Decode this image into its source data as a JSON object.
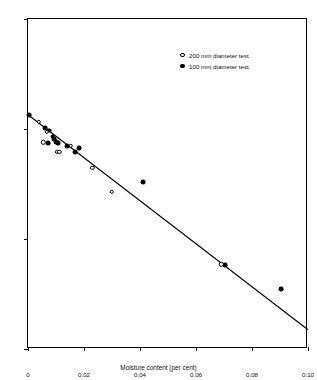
{
  "figure": {
    "top_caption_fragment": "",
    "xlabel": "Moisture content (per cent)",
    "ylabel": "Calibration bulk density (Mg/m³)"
  },
  "legend": {
    "entries": [
      {
        "marker": "open-circle-marker",
        "label": "200 mm diameter test"
      },
      {
        "marker": "filled-circle-marker",
        "label": "100 mm diameter test"
      }
    ]
  },
  "axes": {
    "y_ticks": [
      "1.6",
      "1.5",
      "1.4",
      "1.3"
    ],
    "x_ticks": [
      "0",
      "0.02",
      "0.04",
      "0.06",
      "0.08",
      "0.10"
    ]
  },
  "chart_data": {
    "type": "scatter",
    "title": "",
    "xlabel": "Moisture content (per cent)",
    "ylabel": "Calibration bulk density (Mg/m³)",
    "xlim": [
      0,
      0.1
    ],
    "ylim": [
      1.3,
      1.6
    ],
    "xticks": [
      0,
      0.02,
      0.04,
      0.06,
      0.08,
      0.1
    ],
    "yticks": [
      1.3,
      1.4,
      1.5,
      1.6
    ],
    "grid": false,
    "legend_position": "top-center",
    "series": [
      {
        "name": "100 mm diameter test",
        "marker": "filled-circle",
        "color": "#000000",
        "points": [
          [
            0.0005,
            1.5125
          ],
          [
            0.0062,
            1.5005
          ],
          [
            0.0075,
            1.4985
          ],
          [
            0.0088,
            1.493
          ],
          [
            0.0093,
            1.4905
          ],
          [
            0.01,
            1.488
          ],
          [
            0.0108,
            1.4875
          ],
          [
            0.0072,
            1.487
          ],
          [
            0.014,
            1.4845
          ],
          [
            0.0182,
            1.4825
          ],
          [
            0.0168,
            1.479
          ],
          [
            0.041,
            1.452
          ],
          [
            0.0705,
            1.376
          ],
          [
            0.0905,
            1.3545
          ]
        ]
      },
      {
        "name": "200 mm diameter test",
        "marker": "open-circle",
        "color": "#000000",
        "points": [
          [
            0.0038,
            1.5065
          ],
          [
            0.0068,
            1.4975
          ],
          [
            0.0055,
            1.488
          ],
          [
            0.0105,
            1.4795
          ],
          [
            0.0112,
            1.4795
          ],
          [
            0.0152,
            1.4845
          ],
          [
            0.023,
            1.465
          ],
          [
            0.03,
            1.443
          ],
          [
            0.069,
            1.377
          ]
        ]
      }
    ],
    "trend_line": {
      "type": "linear-fit",
      "x_start": 0.0,
      "y_start": 1.513,
      "x_end": 0.1,
      "y_end": 1.3175
    }
  }
}
